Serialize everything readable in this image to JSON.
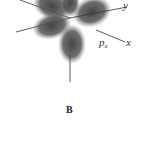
{
  "figure": {
    "labels": {
      "y_axis": "y",
      "x_axis": "x",
      "orbital_main": "p",
      "orbital_sub": "x"
    },
    "caption": "B",
    "colors": {
      "lobe": "#4a4a4a",
      "axis": "#333333",
      "background": "#ffffff"
    }
  }
}
